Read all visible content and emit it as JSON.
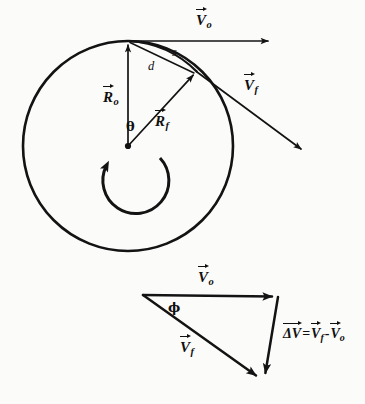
{
  "figure": {
    "background_color": "#fbfbfa",
    "ink_color": "#131313"
  },
  "upper_diagram": {
    "name": "rotating-circle-diagram",
    "circle": {
      "center_x": 128,
      "center_y": 146,
      "radius": 105,
      "stroke_width": 2.6
    },
    "center_point_label": "",
    "rotation_sense": "counterclockwise",
    "labels": {
      "v_initial": {
        "base": "V",
        "sub": "o",
        "accent": "vector-arrow"
      },
      "v_final": {
        "base": "V",
        "sub": "f",
        "accent": "vector-arrow"
      },
      "r_initial": {
        "base": "R",
        "sub": "o",
        "accent": "vector-arrow"
      },
      "r_final": {
        "base": "R",
        "sub": "f",
        "accent": "vector-arrow"
      },
      "arc_length": "s",
      "chord": "d",
      "angle": "θ"
    },
    "vectors": [
      {
        "name": "R_o",
        "from": [
          128,
          146
        ],
        "to": [
          128,
          41
        ],
        "kind": "radius"
      },
      {
        "name": "R_f",
        "from": [
          128,
          146
        ],
        "to": [
          196,
          72
        ],
        "kind": "radius"
      },
      {
        "name": "V_o",
        "from": [
          128,
          41
        ],
        "to": [
          273,
          41
        ],
        "kind": "velocity"
      },
      {
        "name": "V_f",
        "from": [
          196,
          72
        ],
        "to": [
          305,
          152
        ],
        "kind": "velocity"
      }
    ]
  },
  "lower_diagram": {
    "name": "velocity-triangle-diagram",
    "labels": {
      "v_initial": {
        "base": "V",
        "sub": "o",
        "accent": "vector-arrow"
      },
      "v_final": {
        "base": "V",
        "sub": "f",
        "accent": "vector-arrow"
      },
      "angle": "ϕ",
      "delta_equation": {
        "lhs_symbol": "ΔV",
        "equals": "=",
        "minus": "-",
        "term1": {
          "base": "V",
          "sub": "f"
        },
        "term2": {
          "base": "V",
          "sub": "o"
        },
        "full_text": "ΔV = V_f - V_o"
      }
    },
    "vectors": [
      {
        "name": "V_o",
        "from": [
          143,
          295
        ],
        "to": [
          278,
          297
        ],
        "kind": "velocity"
      },
      {
        "name": "V_f",
        "from": [
          143,
          295
        ],
        "to": [
          262,
          380
        ],
        "kind": "velocity"
      },
      {
        "name": "delta_V",
        "from": [
          278,
          297
        ],
        "to": [
          264,
          379
        ],
        "kind": "difference"
      }
    ]
  }
}
